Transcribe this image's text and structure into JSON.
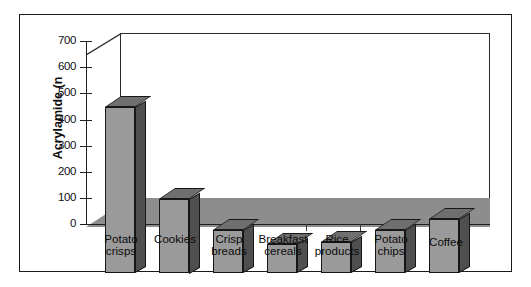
{
  "figure": {
    "background_color": "#ffffff",
    "frame_color": "#1a1a1a"
  },
  "axes": {
    "y_title": "Acrylamide (n",
    "y_ticks": [
      "700",
      "600",
      "500",
      "400",
      "300",
      "200",
      "100",
      "0"
    ],
    "y_tick_values": [
      700,
      600,
      500,
      400,
      300,
      200,
      100,
      0
    ]
  },
  "colors": {
    "bar_front": "#9a9a9a",
    "bar_side": "#4f4f4f",
    "bar_top": "#6f6f6f",
    "floor": "#8d8d8d",
    "outline": "#171717",
    "text": "#0b0b0b"
  },
  "chart_data": {
    "type": "bar",
    "title": "",
    "subtitle": "",
    "xlabel": "",
    "ylabel": "Acrylamide (n",
    "ylim": [
      0,
      700
    ],
    "grid": false,
    "legend": "none",
    "style": "3d-column",
    "categories": [
      "Potato\ncrisps",
      "Cookies",
      "Crisp\nbreads",
      "Breakfast\ncereals",
      "Rice\nproducts",
      "Potato\nchips",
      "Coffee"
    ],
    "category_labels_flat": [
      "Potato crisps",
      "Cookies",
      "Crisp breads",
      "Breakfast cereals",
      "Rice products",
      "Potato chips",
      "Coffee"
    ],
    "values": [
      635,
      285,
      165,
      110,
      120,
      165,
      205
    ]
  }
}
